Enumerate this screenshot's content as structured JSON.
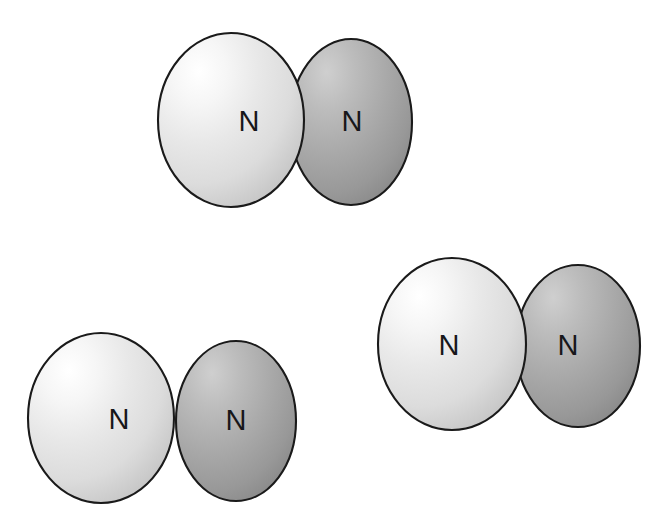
{
  "figure": {
    "background_color": "#ffffff",
    "outline_color": "#1a1a1a",
    "atom_label_color": "#17171a",
    "light_sphere_colors": {
      "highlight": "#ffffff",
      "mid": "#e3e3e3",
      "edge": "#c2c2c2"
    },
    "dark_sphere_colors": {
      "highlight": "#c8c8c8",
      "mid": "#a6a6a6",
      "edge": "#8a8a8a"
    },
    "molecule_count": 3,
    "atoms_per_molecule": 2,
    "element_symbol": "N",
    "molecule_formula": "N2"
  },
  "molecules": [
    {
      "id": "molecule-top",
      "name": "nitrogen-molecule-top",
      "atoms": [
        {
          "id": "atom-top-left",
          "label": "N",
          "shade": "light",
          "cx": 231,
          "cy": 120,
          "rx": 73,
          "ry": 87,
          "label_x": 249,
          "label_y": 131
        },
        {
          "id": "atom-top-right",
          "label": "N",
          "shade": "dark",
          "cx": 351,
          "cy": 122,
          "rx": 61,
          "ry": 83,
          "label_x": 352,
          "label_y": 131
        }
      ]
    },
    {
      "id": "molecule-bottom-left",
      "name": "nitrogen-molecule-bottom-left",
      "atoms": [
        {
          "id": "atom-bl-left",
          "label": "N",
          "shade": "light",
          "cx": 101,
          "cy": 418,
          "rx": 73,
          "ry": 85,
          "label_x": 119,
          "label_y": 429
        },
        {
          "id": "atom-bl-right",
          "label": "N",
          "shade": "dark",
          "cx": 236,
          "cy": 421,
          "rx": 60,
          "ry": 80,
          "label_x": 236,
          "label_y": 430
        }
      ]
    },
    {
      "id": "molecule-bottom-right",
      "name": "nitrogen-molecule-bottom-right",
      "atoms": [
        {
          "id": "atom-br-left",
          "label": "N",
          "shade": "light",
          "cx": 452,
          "cy": 344,
          "rx": 74,
          "ry": 86,
          "label_x": 449,
          "label_y": 355
        },
        {
          "id": "atom-br-right",
          "label": "N",
          "shade": "dark",
          "cx": 578,
          "cy": 346,
          "rx": 62,
          "ry": 81,
          "label_x": 568,
          "label_y": 355
        }
      ]
    }
  ],
  "labels": {
    "atom_n": "N"
  }
}
